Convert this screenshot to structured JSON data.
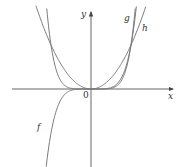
{
  "figure": {
    "type": "function-graph",
    "axes": {
      "x_label": "x",
      "y_label": "y",
      "origin_label": "0"
    },
    "curves": [
      {
        "name": "f",
        "label": "f",
        "expression": "odd power function (e.g. x^5)"
      },
      {
        "name": "g",
        "label": "g",
        "expression": "even higher power (e.g. x^6)"
      },
      {
        "name": "h",
        "label": "h",
        "expression": "x^2"
      }
    ],
    "colors": {
      "curve": "#7a7a7a",
      "axis": "#444444",
      "label": "#333333"
    }
  }
}
